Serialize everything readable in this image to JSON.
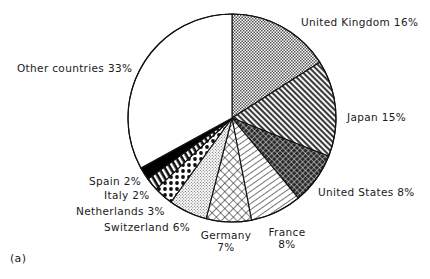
{
  "figure": {
    "caption": "(a)",
    "background_color": "#ffffff",
    "stroke_color": "#111111"
  },
  "chart_data": {
    "type": "pie",
    "title": "",
    "xlabel": "",
    "ylabel": "",
    "legend_position": "outside-labels",
    "grid": false,
    "start_angle_deg": 0,
    "direction": "clockwise",
    "categories": [
      "United Kingdom",
      "Japan",
      "United States",
      "France",
      "Germany",
      "Switzerland",
      "Netherlands",
      "Italy",
      "Spain",
      "Other countries"
    ],
    "values": [
      16,
      15,
      8,
      8,
      7,
      6,
      3,
      2,
      2,
      33
    ],
    "unit": "%",
    "slices": [
      {
        "label": "United Kingdom",
        "value": 16,
        "value_text": "16%",
        "pattern": "fine-checker-dots",
        "fill": "#d9d9d9"
      },
      {
        "label": "Japan",
        "value": 15,
        "value_text": "15%",
        "pattern": "diagonal-hatch-backslash",
        "fill": "#9a9a9a"
      },
      {
        "label": "United States",
        "value": 8,
        "value_text": "8%",
        "pattern": "dense-dark-crosshatch",
        "fill": "#3d3d3d"
      },
      {
        "label": "France",
        "value": 8,
        "value_text": "8%",
        "pattern": "sparse-diagonal-slash",
        "fill": "#ffffff"
      },
      {
        "label": "Germany",
        "value": 7,
        "value_text": "7%",
        "pattern": "open-crosshatch-grid",
        "fill": "#ffffff"
      },
      {
        "label": "Switzerland",
        "value": 6,
        "value_text": "6%",
        "pattern": "fine-stipple",
        "fill": "#e8e8e8"
      },
      {
        "label": "Netherlands",
        "value": 3,
        "value_text": "3%",
        "pattern": "large-polka-dots",
        "fill": "#ffffff"
      },
      {
        "label": "Italy",
        "value": 2,
        "value_text": "2%",
        "pattern": "bold-diagonal-stripes",
        "fill": "#ffffff"
      },
      {
        "label": "Spain",
        "value": 2,
        "value_text": "2%",
        "pattern": "solid-black",
        "fill": "#000000"
      },
      {
        "label": "Other countries",
        "value": 33,
        "value_text": "33%",
        "pattern": "plain-white",
        "fill": "#ffffff"
      }
    ]
  },
  "labels": {
    "united_kingdom": "United Kingdom  16%",
    "japan": "Japan  15%",
    "united_states": "United States  8%",
    "france_name": "France",
    "france_value": "8%",
    "germany_name": "Germany",
    "germany_value": "7%",
    "switzerland": "Switzerland  6%",
    "netherlands": "Netherlands  3%",
    "italy": "Italy  2%",
    "spain": "Spain  2%",
    "other_countries": "Other countries  33%"
  }
}
